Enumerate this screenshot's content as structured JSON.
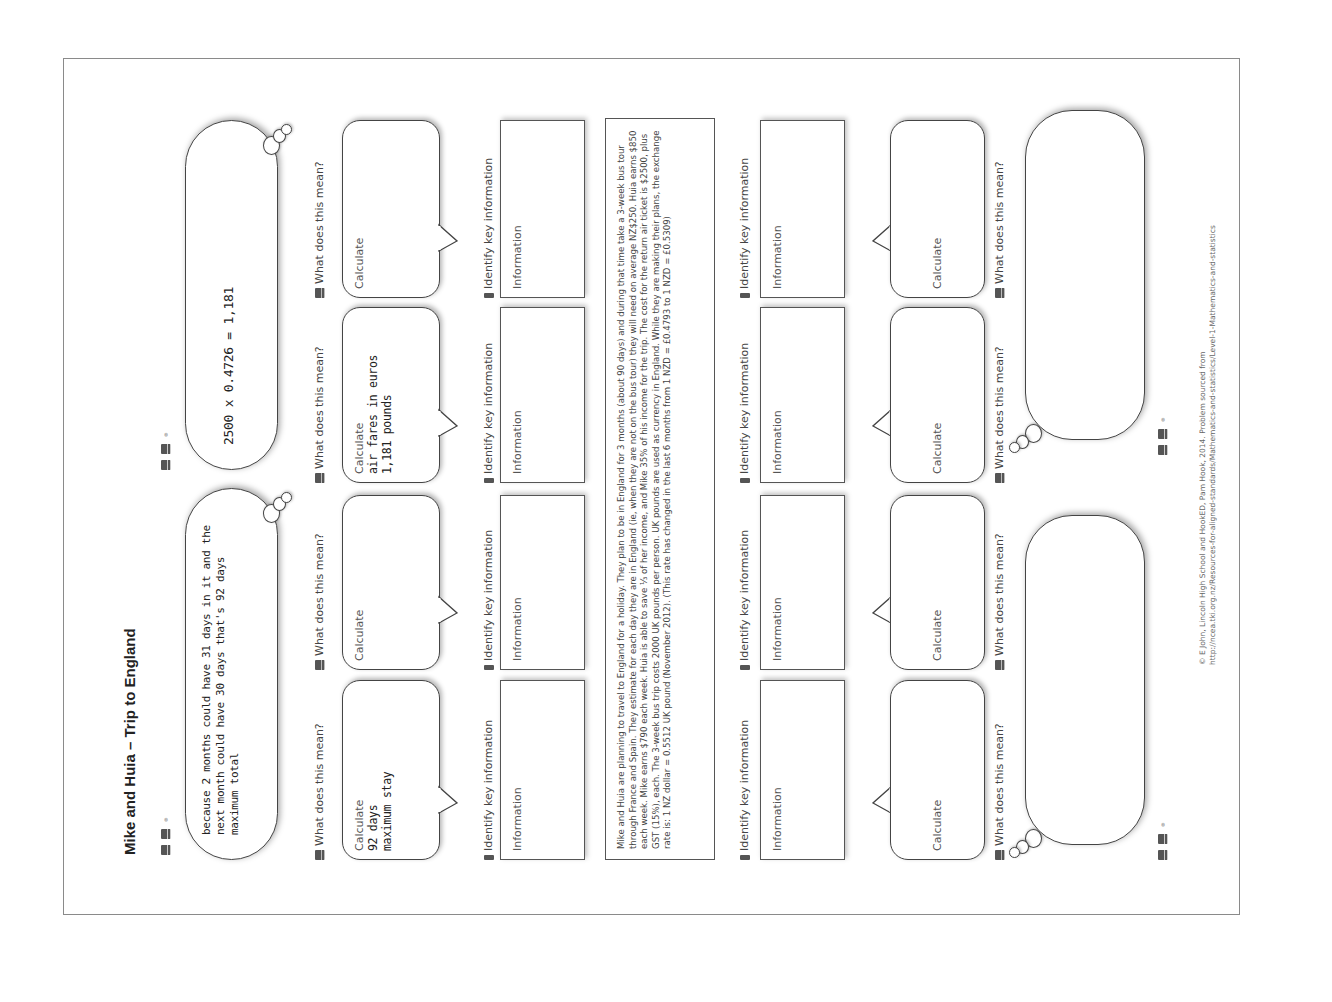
{
  "worksheet": {
    "title": "Mike and Huia – Trip to England",
    "top_clouds": [
      {
        "text": "because 2 months could have 31 days in it and the next month could have 30 days that's 92 days maximum total"
      },
      {
        "text": "2500 x 0.4726 = 1,181"
      }
    ],
    "bottom_clouds": [
      {
        "text": ""
      },
      {
        "text": ""
      }
    ],
    "question_label": "What does this mean?",
    "key_info_label": "Identify key information",
    "upper_bubbles": [
      {
        "label": "Calculate",
        "answer": "92 days\nmaximum stay"
      },
      {
        "label": "Calculate",
        "answer": ""
      },
      {
        "label": "Calculate",
        "answer": "air fares in euros\n1,181 pounds"
      },
      {
        "label": "Calculate",
        "answer": ""
      }
    ],
    "upper_info_boxes": [
      {
        "label": "Information"
      },
      {
        "label": "Information"
      },
      {
        "label": "Information"
      },
      {
        "label": "Information"
      }
    ],
    "lower_info_boxes": [
      {
        "label": "Information"
      },
      {
        "label": "Information"
      },
      {
        "label": "Information"
      },
      {
        "label": "Information"
      }
    ],
    "lower_bubbles": [
      {
        "label": "Calculate"
      },
      {
        "label": "Calculate"
      },
      {
        "label": "Calculate"
      },
      {
        "label": "Calculate"
      }
    ],
    "problem_text": "Mike and Huia are planning to travel to England for a holiday. They plan to be in England for 3 months (about 90 days) and during that time take a 3-week bus tour through France and Spain. They estimate for each day they are in England (ie, when they are not on the bus tour) they will need on average NZ$250. Huia earns $850 each week. Mike earns $790 each week. Huia is able to save ⅓ of her income, and Mike 35% of his income for the trip. The cost for the return air ticket is $2500, plus GST (15%), each. The 3-week bus trip costs 2000 UK pounds per person. UK pounds are used as currency in England. While they are making their plans, the exchange rate is: 1 NZ dollar = 0.5512 UK pound (November 2012). (This rate has changed in the last 6 months from 1 NZD = £0.4793 to 1 NZD = £0.5309)",
    "footer": {
      "line1": "© E John, Lincoln High School and HookED, Pam Hook, 2014. Problem sourced from",
      "line2": "http://ncea.tki.org.nz/Resources-for-aligned-standards/Mathematics-and-statistics/Level-1-Mathematics-and-statistics"
    }
  }
}
